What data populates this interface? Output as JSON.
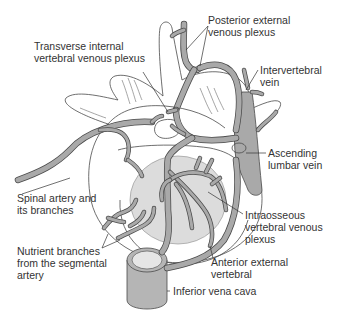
{
  "diagram": {
    "colors": {
      "vessel_fill": "#a9a9a9",
      "vessel_outline": "#4a4a4a",
      "vertebral_body_fill": "#dcdcdc",
      "text": "#333333",
      "background": "#ffffff"
    },
    "labels": [
      {
        "id": "posterior-external",
        "text": "Posterior external\nvenous plexus",
        "x": 208,
        "y": 14
      },
      {
        "id": "transverse-internal",
        "text": "Transverse internal\nvertebral venous plexus",
        "x": 34,
        "y": 40
      },
      {
        "id": "intervertebral-vein",
        "text": "Intervertebral\nvein",
        "x": 260,
        "y": 64
      },
      {
        "id": "ascending-lumbar",
        "text": "Ascending\nlumbar vein",
        "x": 268,
        "y": 147
      },
      {
        "id": "spinal-artery",
        "text": "Spinal artery and\nits branches",
        "x": 17,
        "y": 192
      },
      {
        "id": "intraosseous",
        "text": "Intraosseous\nvertebral venous\nplexus",
        "x": 245,
        "y": 209
      },
      {
        "id": "nutrient-branches",
        "text": "Nutrient branches\nfrom the segmental\nartery",
        "x": 17,
        "y": 245
      },
      {
        "id": "anterior-external",
        "text": "Anterior external\nvertebral",
        "x": 211,
        "y": 256
      },
      {
        "id": "inferior-vena-cava",
        "text": "Inferior vena cava",
        "x": 173,
        "y": 287
      }
    ]
  }
}
